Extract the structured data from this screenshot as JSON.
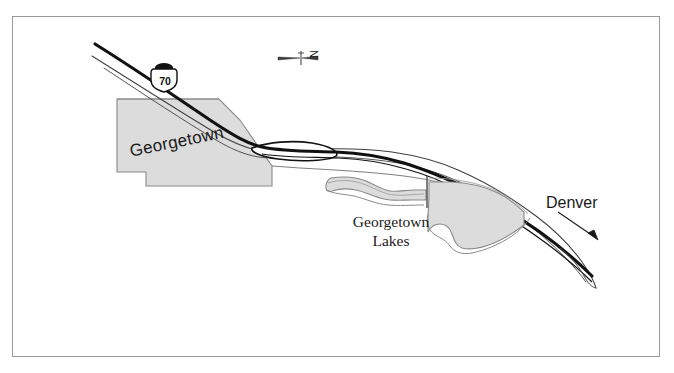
{
  "figure": {
    "kind": "reference-location-map",
    "background_color": "#ffffff",
    "frame_color": "#9a9a9a",
    "frame_rect": {
      "x": 12,
      "y": 16,
      "width": 648,
      "height": 341
    }
  },
  "labels": {
    "town": "Georgetown",
    "lakes_line1": "Georgetown",
    "lakes_line2": "Lakes",
    "destination": "Denver",
    "north_letter": "N"
  },
  "route_shield": {
    "type": "interstate-shield",
    "number": "70",
    "fill_color": "#ffffff",
    "outline_color": "#111111",
    "crown_color": "#111111"
  },
  "symbols": {
    "north_arrow": "north-arrow-icon",
    "direction_arrow": "direction-arrow-icon",
    "town_polygon": "town-area-polygon",
    "lake_west_polygon": "lake-polygon-west",
    "lake_east_polygon": "lake-polygon-east",
    "dam_line": "dam-line",
    "highway_line": "interstate-70-centerline",
    "frontage_line": "frontage-road-line",
    "creek_line": "creek-line"
  },
  "colors": {
    "fill_gray": "#dcdcdc",
    "outline_gray": "#8a8a8a",
    "highway_black": "#111111",
    "thin_line": "#4a4a4a",
    "text": "#1a1a1a"
  },
  "features": [
    {
      "name": "Georgetown",
      "type": "town-area"
    },
    {
      "name": "Georgetown Lakes",
      "type": "water-body-pair"
    },
    {
      "name": "Interstate 70",
      "type": "highway"
    },
    {
      "name": "Denver",
      "type": "direction-destination"
    }
  ]
}
